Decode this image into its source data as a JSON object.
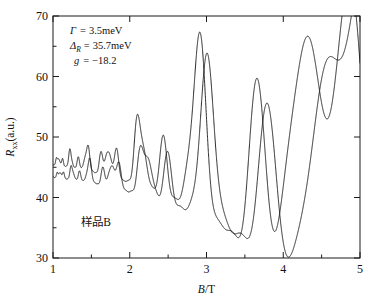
{
  "chart_data": {
    "type": "line",
    "title": "",
    "subtitle": "",
    "xlabel_italic": "B",
    "xlabel_rest": "/T",
    "xlabel": "B/T",
    "ylabel_main": "R",
    "ylabel_sub": "xx",
    "ylabel_rest": "(a.u.)",
    "ylabel": "Rxx(a.u.)",
    "xlim": [
      1,
      5
    ],
    "ylim": [
      30,
      70
    ],
    "x_ticks": [
      1,
      2,
      3,
      4,
      5
    ],
    "x_tick_labels": [
      "1",
      "2",
      "3",
      "4",
      "5"
    ],
    "x_minor_ticks": [
      1.5,
      2.5,
      3.5,
      4.5
    ],
    "y_ticks": [
      30,
      40,
      50,
      60,
      70
    ],
    "y_tick_labels": [
      "30",
      "40",
      "50",
      "60",
      "70"
    ],
    "y_minor_ticks": [
      35,
      45,
      55,
      65
    ],
    "grid": false,
    "legend": null,
    "series": [
      {
        "name": "upper-trace",
        "baseline": 46.0,
        "color": "#111111",
        "description": "Shubnikov-de Haas oscillation trace, upper curve, spin-split Landau levels, amplitude grows with B"
      },
      {
        "name": "lower-trace",
        "baseline": 43.8,
        "color": "#111111",
        "description": "Shubnikov-de Haas oscillation trace, lower curve offset below upper, spin-split Landau levels"
      }
    ],
    "annotations": [
      {
        "name": "gamma-line",
        "symbol": "Γ",
        "subscript": "",
        "equals": "=",
        "value": "3.5meV"
      },
      {
        "name": "delta-line",
        "symbol": "Δ",
        "subscript": "R",
        "equals": "=",
        "value": "35.7meV"
      },
      {
        "name": "g-factor-line",
        "symbol": "g",
        "subscript": "",
        "equals": "=",
        "value": "−18.2"
      }
    ],
    "sample_label": "样品B",
    "axis_color": "#1a1a1a",
    "background_color": "#ffffff",
    "curve_color": "#111111"
  }
}
